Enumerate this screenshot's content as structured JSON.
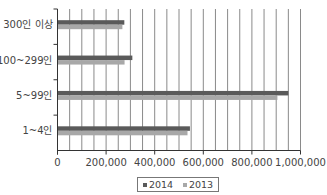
{
  "chart_data": {
    "type": "bar",
    "orientation": "horizontal",
    "title": "",
    "xlabel": "",
    "ylabel": "",
    "categories": [
      "300인 이상",
      "100~299인",
      "5~99인",
      "1~4인"
    ],
    "series": [
      {
        "name": "2014",
        "color": "#5a5a5a",
        "values": [
          275000,
          308000,
          950000,
          545000
        ]
      },
      {
        "name": "2013",
        "color": "#a8a8a8",
        "values": [
          267000,
          276000,
          905000,
          535000
        ]
      }
    ],
    "xlim": [
      0,
      1000000
    ],
    "x_ticks": [
      0,
      200000,
      400000,
      600000,
      800000,
      1000000
    ],
    "x_tick_labels": [
      "0",
      "200,000",
      "400,000",
      "600,000",
      "800,000",
      "1,000,000"
    ],
    "grid": {
      "vertical": true,
      "interval": 50000
    },
    "legend": {
      "position": "bottom",
      "entries": [
        "2014",
        "2013"
      ]
    }
  }
}
